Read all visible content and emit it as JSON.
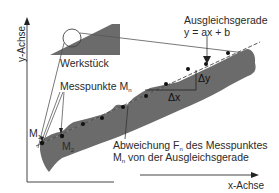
{
  "diagram": {
    "title": "",
    "axes": {
      "x_label": "x-Achse",
      "y_label": "y-Achse"
    },
    "labels": {
      "workpiece": "Werkstück",
      "measure_points": "Messpunkte M",
      "measure_points_sub": "n",
      "m1": "M",
      "m1_sub": "1",
      "m2": "M",
      "m2_sub": "2",
      "fit_line_title": "Ausgleichsgerade",
      "fit_line_eq": "y = ax + b",
      "delta_x": "Δx",
      "delta_y": "Δy",
      "deviation_line1_a": "Abweichung F",
      "deviation_line1_sub": "n",
      "deviation_line1_b": " des Messpunktes",
      "deviation_line2_a": "M",
      "deviation_line2_sub": "n",
      "deviation_line2_b": " von der Ausgleichsgerade"
    },
    "colors": {
      "workpiece_fill": "#6b6b6b",
      "line": "#333333",
      "text": "#2a2a2a",
      "background": "#ffffff"
    }
  }
}
